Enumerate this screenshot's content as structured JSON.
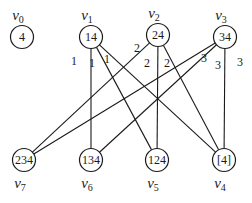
{
  "diagram": {
    "type": "bipartite-graph",
    "nodes": [
      {
        "id": "v0",
        "name": "v",
        "sub": "0",
        "value": "4",
        "x": 22,
        "y": 37
      },
      {
        "id": "v1",
        "name": "v",
        "sub": "1",
        "value": "14",
        "x": 91,
        "y": 37
      },
      {
        "id": "v2",
        "name": "v",
        "sub": "2",
        "value": "24",
        "x": 158,
        "y": 35
      },
      {
        "id": "v3",
        "name": "v",
        "sub": "3",
        "value": "34",
        "x": 225,
        "y": 37
      },
      {
        "id": "v7",
        "name": "v",
        "sub": "7",
        "value": "234",
        "x": 24,
        "y": 160
      },
      {
        "id": "v6",
        "name": "v",
        "sub": "6",
        "value": "134",
        "x": 91,
        "y": 160
      },
      {
        "id": "v5",
        "name": "v",
        "sub": "5",
        "value": "124",
        "x": 157,
        "y": 160
      },
      {
        "id": "v4",
        "name": "v",
        "sub": "4",
        "value": "[4]",
        "x": 224,
        "y": 160
      }
    ],
    "edges": [
      {
        "from": "v1",
        "to": "v6",
        "weight": "1"
      },
      {
        "from": "v1",
        "to": "v5",
        "weight": "1"
      },
      {
        "from": "v1",
        "to": "v4",
        "weight": "1"
      },
      {
        "from": "v2",
        "to": "v7",
        "weight": "2"
      },
      {
        "from": "v2",
        "to": "v5",
        "weight": "2"
      },
      {
        "from": "v2",
        "to": "v4",
        "weight": "2"
      },
      {
        "from": "v3",
        "to": "v7",
        "weight": "3"
      },
      {
        "from": "v3",
        "to": "v6",
        "weight": "3"
      },
      {
        "from": "v3",
        "to": "v4",
        "weight": "3"
      }
    ],
    "weight_labels": [
      {
        "text": "1",
        "x": 74,
        "y": 65
      },
      {
        "text": "1",
        "x": 92,
        "y": 67
      },
      {
        "text": "1",
        "x": 107,
        "y": 63
      },
      {
        "text": "2",
        "x": 137,
        "y": 52
      },
      {
        "text": "2",
        "x": 147,
        "y": 67
      },
      {
        "text": "2",
        "x": 167,
        "y": 67
      },
      {
        "text": "3",
        "x": 204,
        "y": 62
      },
      {
        "text": "3",
        "x": 218,
        "y": 69
      },
      {
        "text": "3",
        "x": 240,
        "y": 66
      }
    ]
  }
}
